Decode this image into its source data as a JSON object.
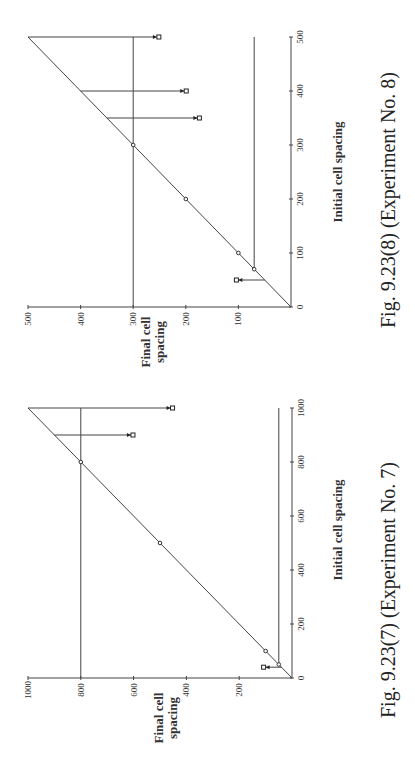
{
  "chart_data": [
    {
      "id": "exp8",
      "type": "scatter",
      "title": "",
      "caption": "Fig. 9.23(8)   (Experiment No. 8)",
      "xlabel": "Initial cell spacing",
      "ylabel": "Final cell spacing",
      "xlim": [
        0,
        500
      ],
      "ylim": [
        0,
        500
      ],
      "x_ticks": [
        0,
        100,
        200,
        300,
        400,
        500
      ],
      "y_ticks": [
        0,
        100,
        200,
        300,
        400,
        500
      ],
      "grid": false,
      "reference_line": "y = x",
      "threshold_lines": {
        "lower": 70,
        "upper": 300
      },
      "points_on_line": [
        {
          "x": 70,
          "y": 70
        },
        {
          "x": 100,
          "y": 100
        },
        {
          "x": 200,
          "y": 200
        },
        {
          "x": 300,
          "y": 300
        }
      ],
      "arrows": [
        {
          "x": 50,
          "from": 50,
          "to": 100
        },
        {
          "x": 350,
          "from": 350,
          "to": 178
        },
        {
          "x": 400,
          "from": 400,
          "to": 203
        },
        {
          "x": 500,
          "from": 500,
          "to": 255
        }
      ]
    },
    {
      "id": "exp7",
      "type": "scatter",
      "title": "",
      "caption": "Fig. 9.23(7)   (Experiment No. 7)",
      "xlabel": "Initial cell spacing",
      "ylabel": "Final cell spacing",
      "xlim": [
        0,
        1000
      ],
      "ylim": [
        0,
        1000
      ],
      "x_ticks": [
        0,
        200,
        400,
        600,
        800,
        1000
      ],
      "y_ticks": [
        0,
        200,
        400,
        600,
        800,
        1000
      ],
      "grid": false,
      "reference_line": "y = x",
      "threshold_lines": {
        "lower": 50,
        "upper": 800
      },
      "points_on_line": [
        {
          "x": 50,
          "y": 50
        },
        {
          "x": 100,
          "y": 100
        },
        {
          "x": 500,
          "y": 500
        },
        {
          "x": 800,
          "y": 800
        }
      ],
      "arrows": [
        {
          "x": 40,
          "from": 40,
          "to": 100
        },
        {
          "x": 900,
          "from": 900,
          "to": 610
        },
        {
          "x": 1000,
          "from": 1000,
          "to": 460
        }
      ]
    }
  ],
  "charts": {
    "exp8": {
      "caption": "Fig. 9.23(8)   (Experiment No. 8)",
      "xlabel": "Initial cell spacing",
      "ylabel_line1": "Final cell",
      "ylabel_line2": "spacing"
    },
    "exp7": {
      "caption": "Fig. 9.23(7)   (Experiment No. 7)",
      "xlabel": "Initial cell spacing",
      "ylabel_line1": "Final cell",
      "ylabel_line2": "spacing"
    }
  }
}
